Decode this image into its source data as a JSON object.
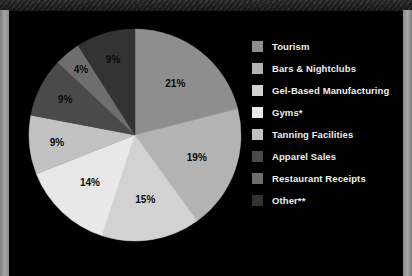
{
  "chart_data": {
    "type": "pie",
    "title": "",
    "legend_position": "right",
    "start_angle_deg": 0,
    "direction": "clockwise",
    "categories": [
      "Tourism",
      "Bars & Nightclubs",
      "Gel-Based Manufacturing",
      "Gyms*",
      "Tanning Facilities",
      "Apparel Sales",
      "Restaurant Receipts",
      "Other**"
    ],
    "values": [
      21,
      19,
      15,
      14,
      9,
      9,
      4,
      9
    ],
    "value_labels": [
      "21%",
      "19%",
      "15%",
      "14%",
      "9%",
      "9%",
      "4%",
      "9%"
    ],
    "colors": [
      "#8e8e8e",
      "#b3b3b3",
      "#d2d2d2",
      "#e8e8e8",
      "#c2c2c2",
      "#4a4a4a",
      "#6e6e6e",
      "#333333"
    ],
    "slices": [
      {
        "label": "Tourism",
        "value": 21,
        "value_label": "21%",
        "color": "#8e8e8e"
      },
      {
        "label": "Bars & Nightclubs",
        "value": 19,
        "value_label": "19%",
        "color": "#b3b3b3"
      },
      {
        "label": "Gel-Based Manufacturing",
        "value": 15,
        "value_label": "15%",
        "color": "#d2d2d2"
      },
      {
        "label": "Gyms*",
        "value": 14,
        "value_label": "14%",
        "color": "#e8e8e8"
      },
      {
        "label": "Tanning Facilities",
        "value": 9,
        "value_label": "9%",
        "color": "#c2c2c2"
      },
      {
        "label": "Apparel Sales",
        "value": 9,
        "value_label": "9%",
        "color": "#4a4a4a"
      },
      {
        "label": "Restaurant Receipts",
        "value": 4,
        "value_label": "4%",
        "color": "#6e6e6e"
      },
      {
        "label": "Other**",
        "value": 9,
        "value_label": "9%",
        "color": "#333333"
      }
    ]
  },
  "legend": {
    "items": [
      {
        "label": "Tourism",
        "color": "#8e8e8e"
      },
      {
        "label": "Bars & Nightclubs",
        "color": "#b3b3b3"
      },
      {
        "label": "Gel-Based Manufacturing",
        "color": "#d2d2d2"
      },
      {
        "label": "Gyms*",
        "color": "#e8e8e8"
      },
      {
        "label": "Tanning Facilities",
        "color": "#c2c2c2"
      },
      {
        "label": "Apparel Sales",
        "color": "#4a4a4a"
      },
      {
        "label": "Restaurant Receipts",
        "color": "#6e6e6e"
      },
      {
        "label": "Other**",
        "color": "#333333"
      }
    ]
  },
  "theme": {
    "background": "#000000",
    "page_margin": "#8c8c8c",
    "texture_band": "#3a3a3a",
    "label_text": "#0b0b0b",
    "legend_text": "#efefef"
  }
}
